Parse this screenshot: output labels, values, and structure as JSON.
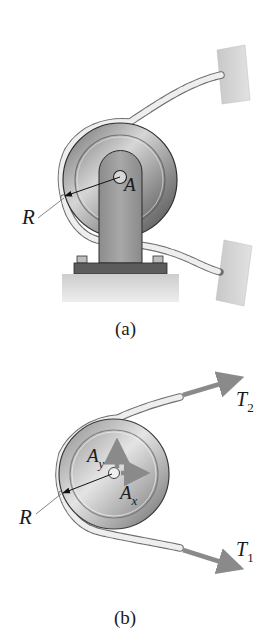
{
  "figure": {
    "panel_a": {
      "caption": "(a)",
      "labels": {
        "radius": "R",
        "pin": "A"
      },
      "parts": [
        "pulley-wheel",
        "support-bracket",
        "base-plate",
        "ground",
        "rope",
        "upper-wall-anchor",
        "lower-wall-anchor"
      ]
    },
    "panel_b": {
      "caption": "(b)",
      "labels": {
        "radius": "R",
        "reaction_y": "A",
        "reaction_y_sub": "y",
        "reaction_x": "A",
        "reaction_x_sub": "x",
        "tension_upper": "T",
        "tension_upper_sub": "2",
        "tension_lower": "T",
        "tension_lower_sub": "1"
      },
      "parts": [
        "pulley-free-body",
        "rope",
        "force-arrow-Ay",
        "force-arrow-Ax",
        "force-arrow-T2",
        "force-arrow-T1"
      ]
    },
    "colors": {
      "force_arrow": "#8a8a8a",
      "pulley_dark": "#4a4a4a",
      "pulley_light": "#d9d9d9",
      "bracket": "#9a9a9a",
      "base_plate": "#5a5a5a",
      "ground": "#d4d4d4",
      "wall": "#cfcfcf",
      "rope": "#e6e6e6"
    }
  }
}
